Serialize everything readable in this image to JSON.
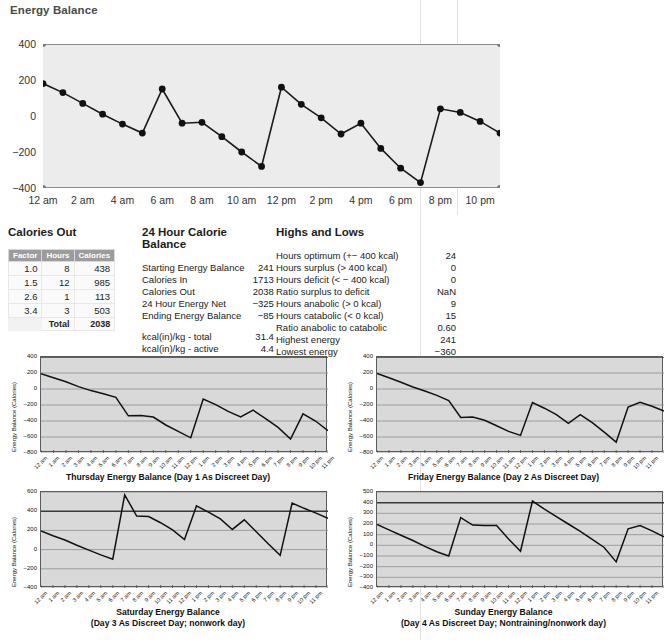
{
  "page": {
    "title": "Energy Balance"
  },
  "main_chart": {
    "y_ticks": [
      400,
      200,
      0,
      -200,
      -400
    ],
    "x_ticks": [
      "12 am",
      "2 am",
      "4 am",
      "6 am",
      "8 am",
      "10 am",
      "12 pm",
      "2 pm",
      "4 pm",
      "6 pm",
      "8 pm",
      "10 pm"
    ],
    "plot_bg": "#ececec",
    "line_color": "#1a1a1a"
  },
  "panels": {
    "calories_out": {
      "title": "Calories Out",
      "columns": [
        "Factor",
        "Hours",
        "Calories"
      ],
      "rows": [
        [
          "1.0",
          "8",
          "438"
        ],
        [
          "1.5",
          "12",
          "985"
        ],
        [
          "2.6",
          "1",
          "113"
        ],
        [
          "3.4",
          "3",
          "503"
        ]
      ],
      "total_label": "Total",
      "total_value": "2038"
    },
    "calorie_balance_24h": {
      "title": "24 Hour Calorie Balance",
      "rows": [
        {
          "label": "Starting Energy Balance",
          "value": "241"
        },
        {
          "label": "Calories In",
          "value": "1713"
        },
        {
          "label": "Calories Out",
          "value": "2038"
        },
        {
          "label": "24 Hour Energy Net",
          "value": "−325"
        },
        {
          "label": "Ending Energy Balance",
          "value": "−85"
        }
      ],
      "rows2": [
        {
          "label": "kcal(in)/kg - total",
          "value": "31.4"
        },
        {
          "label": "kcal(in)/kg - active",
          "value": "4.4"
        }
      ]
    },
    "highs_and_lows": {
      "title": "Highs and Lows",
      "rows": [
        {
          "label": "Hours optimum (+− 400 kcal)",
          "value": "24"
        },
        {
          "label": "Hours surplus (> 400 kcal)",
          "value": "0"
        },
        {
          "label": "Hours deficit (< − 400 kcal)",
          "value": "0"
        },
        {
          "label": "Ratio surplus to deficit",
          "value": "NaN"
        },
        {
          "label": "Hours anabolic (> 0 kcal)",
          "value": "9"
        },
        {
          "label": "Hours catabolic (< 0 kcal)",
          "value": "15"
        },
        {
          "label": "Ratio anabolic to catabolic",
          "value": "0.60"
        },
        {
          "label": "Highest energy",
          "value": "241"
        },
        {
          "label": "Lowest energy",
          "value": "−360"
        }
      ]
    }
  },
  "small_charts": [
    {
      "caption": [
        "Thursday Energy Balance (Day 1 As Discreet Day)"
      ],
      "ylabel": "Energy Balance (Calories)"
    },
    {
      "caption": [
        "Friday Energy Balance (Day 2 As Discreet Day)"
      ],
      "ylabel": "Energy Balance (Calories)"
    },
    {
      "caption": [
        "Saturday Energy Balance",
        "(Day 3 As Discreet Day; nonwork day)"
      ],
      "ylabel": "Energy Balance (Calories)"
    },
    {
      "caption": [
        "Sunday Energy Balance",
        "(Day 4 As Discreet Day; Nontraining/nonwork day)"
      ],
      "ylabel": "Energy Balance (Calories)"
    }
  ],
  "chart_data": [
    {
      "id": "main",
      "type": "line",
      "title": "Energy Balance",
      "xlabel": "",
      "ylabel": "",
      "ylim": [
        -400,
        400
      ],
      "yticks": [
        -400,
        -200,
        0,
        200,
        400
      ],
      "markers": true,
      "grid": false,
      "categories": [
        "12 am",
        "1 am",
        "2 am",
        "3 am",
        "4 am",
        "5 am",
        "6 am",
        "7 am",
        "8 am",
        "9 am",
        "10 am",
        "11 am",
        "12 pm",
        "1 pm",
        "2 pm",
        "3 pm",
        "4 pm",
        "5 pm",
        "6 pm",
        "7 pm",
        "8 pm",
        "9 pm",
        "10 pm",
        "11 pm"
      ],
      "tick_labels": [
        "12 am",
        "2 am",
        "4 am",
        "6 am",
        "8 am",
        "10 am",
        "12 pm",
        "2 pm",
        "4 pm",
        "6 pm",
        "8 pm",
        "10 pm"
      ],
      "values": [
        180,
        130,
        70,
        10,
        -45,
        -95,
        150,
        -40,
        -35,
        -115,
        -200,
        -280,
        160,
        65,
        -10,
        -100,
        -40,
        -180,
        -290,
        -370,
        40,
        20,
        -30,
        -95
      ]
    },
    {
      "id": "thursday",
      "type": "line",
      "title": "Thursday Energy Balance (Day 1 As Discreet Day)",
      "ylabel": "Energy Balance (Calories)",
      "ylim": [
        -800,
        400
      ],
      "yticks": [
        400,
        200,
        0,
        -200,
        -400,
        -600,
        -800
      ],
      "grid": true,
      "markers": false,
      "categories": [
        "12 am",
        "1 am",
        "2 am",
        "3 am",
        "4 am",
        "5 am",
        "6 am",
        "7 am",
        "8 am",
        "9 am",
        "10 am",
        "11 am",
        "12 pm",
        "1 pm",
        "2 pm",
        "3 pm",
        "4 pm",
        "5 pm",
        "6 pm",
        "7 pm",
        "8 pm",
        "9 pm",
        "10 pm",
        "11 pm"
      ],
      "values": [
        190,
        140,
        90,
        30,
        -20,
        -60,
        -105,
        -335,
        -330,
        -350,
        -450,
        -530,
        -610,
        -125,
        -195,
        -280,
        -350,
        -265,
        -370,
        -480,
        -625,
        -310,
        -400,
        -520
      ]
    },
    {
      "id": "friday",
      "type": "line",
      "title": "Friday Energy Balance (Day 2 As Discreet Day)",
      "ylabel": "Energy Balance (Calories)",
      "ylim": [
        -800,
        400
      ],
      "yticks": [
        400,
        200,
        0,
        -200,
        -400,
        -600,
        -800
      ],
      "grid": true,
      "markers": false,
      "categories": [
        "12 am",
        "1 am",
        "2 am",
        "3 am",
        "4 am",
        "5 am",
        "6 am",
        "7 am",
        "8 am",
        "9 am",
        "10 am",
        "11 am",
        "12 pm",
        "1 pm",
        "2 pm",
        "3 pm",
        "4 pm",
        "5 pm",
        "6 pm",
        "7 pm",
        "8 pm",
        "9 pm",
        "10 pm",
        "11 pm"
      ],
      "values": [
        195,
        140,
        85,
        25,
        -25,
        -80,
        -145,
        -355,
        -350,
        -390,
        -460,
        -530,
        -580,
        -170,
        -240,
        -320,
        -430,
        -320,
        -420,
        -540,
        -665,
        -225,
        -165,
        -215,
        -275
      ]
    },
    {
      "id": "saturday",
      "type": "line",
      "title": "Saturday Energy Balance",
      "subtitle": "(Day 3 As Discreet Day; nonwork day)",
      "ylabel": "Energy Balance (Calories)",
      "ylim": [
        -400,
        600
      ],
      "yticks": [
        600,
        400,
        200,
        0,
        -200,
        -400
      ],
      "grid": true,
      "markers": false,
      "categories": [
        "12 am",
        "1 am",
        "2 am",
        "3 am",
        "4 am",
        "5 am",
        "6 am",
        "7 am",
        "8 am",
        "9 am",
        "10 am",
        "11 am",
        "12 pm",
        "1 pm",
        "2 pm",
        "3 pm",
        "4 pm",
        "5 pm",
        "6 pm",
        "7 pm",
        "8 pm",
        "9 pm",
        "10 pm",
        "11 pm"
      ],
      "values": [
        195,
        145,
        100,
        45,
        -5,
        -55,
        -100,
        570,
        350,
        345,
        280,
        205,
        105,
        455,
        390,
        320,
        210,
        310,
        185,
        60,
        -60,
        485,
        430,
        380,
        325
      ]
    },
    {
      "id": "sunday",
      "type": "line",
      "title": "Sunday Energy Balance",
      "subtitle": "(Day 4 As Discreet Day; Nontraining/nonwork day)",
      "ylabel": "Energy Balance (Calories)",
      "ylim": [
        -400,
        500
      ],
      "yticks": [
        500,
        400,
        300,
        200,
        100,
        0,
        -100,
        -200,
        -300,
        -400
      ],
      "grid": true,
      "markers": false,
      "categories": [
        "12 am",
        "1 am",
        "2 am",
        "3 am",
        "4 am",
        "5 am",
        "6 am",
        "7 am",
        "8 am",
        "9 am",
        "10 am",
        "11 am",
        "12 pm",
        "1 pm",
        "2 pm",
        "3 pm",
        "4 pm",
        "5 pm",
        "6 pm",
        "7 pm",
        "8 pm",
        "9 pm",
        "10 pm",
        "11 pm"
      ],
      "values": [
        195,
        145,
        95,
        45,
        -10,
        -60,
        -100,
        260,
        190,
        185,
        185,
        60,
        -55,
        415,
        340,
        270,
        200,
        130,
        55,
        -20,
        -155,
        155,
        185,
        135,
        80
      ]
    }
  ],
  "x_hour_labels": [
    "12 am",
    "1 am",
    "2 am",
    "3 am",
    "4 am",
    "5 am",
    "6 am",
    "7 am",
    "8 am",
    "9 am",
    "10 am",
    "11 am",
    "12 pm",
    "1 pm",
    "2 pm",
    "3 pm",
    "4 pm",
    "5 pm",
    "6 pm",
    "7 pm",
    "8 pm",
    "9 pm",
    "10 pm",
    "11 pm"
  ]
}
